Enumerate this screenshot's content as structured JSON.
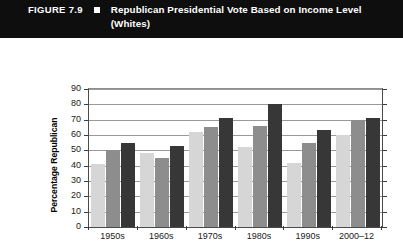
{
  "header": {
    "figure_label": "FIGURE 7.9",
    "bullet_icon": "square-bullet-icon",
    "title": "Republican Presidential Vote Based on Income Level (Whites)",
    "background_color": "#0e0e0e",
    "text_color": "#ffffff"
  },
  "chart_data": {
    "type": "bar",
    "title": "Republican Presidential Vote Based on Income Level (Whites)",
    "xlabel": "",
    "ylabel": "Percentage Republican",
    "ylim": [
      0,
      90
    ],
    "ytick_step": 10,
    "yticks": [
      "0",
      "10",
      "20",
      "30",
      "40",
      "50",
      "60",
      "70",
      "80",
      "90"
    ],
    "grid": true,
    "grid_axis": "y",
    "legend_position": "bottom",
    "categories": [
      "1950s",
      "1960s",
      "1970s",
      "1980s",
      "1990s",
      "2000–12"
    ],
    "series": [
      {
        "name": "Low Income",
        "color": "#d6d6d6",
        "values": [
          41,
          48,
          62,
          52,
          42,
          60
        ]
      },
      {
        "name": "Middle Income",
        "color": "#8d8d8d",
        "values": [
          50,
          45,
          65,
          66,
          55,
          70
        ]
      },
      {
        "name": "High Income",
        "color": "#373737",
        "values": [
          55,
          53,
          71,
          80,
          63,
          71
        ]
      }
    ]
  }
}
